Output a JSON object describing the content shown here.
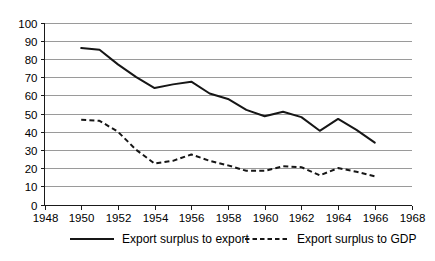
{
  "chart_data": {
    "type": "line",
    "title": "",
    "xlabel": "",
    "ylabel": "",
    "xlim": [
      1948,
      1968
    ],
    "ylim": [
      0,
      100
    ],
    "grid": true,
    "legend_position": "bottom",
    "x_tick_labels": [
      "1948",
      "1950",
      "1952",
      "1954",
      "1956",
      "1958",
      "1960",
      "1962",
      "1964",
      "1966",
      "1968"
    ],
    "x_ticks": [
      1948,
      1950,
      1952,
      1954,
      1956,
      1958,
      1960,
      1962,
      1964,
      1966,
      1968
    ],
    "y_tick_labels": [
      "0",
      "10",
      "20",
      "30",
      "40",
      "50",
      "60",
      "70",
      "80",
      "90",
      "100"
    ],
    "y_ticks": [
      0,
      10,
      20,
      30,
      40,
      50,
      60,
      70,
      80,
      90,
      100
    ],
    "x": [
      1950,
      1951,
      1952,
      1953,
      1954,
      1955,
      1956,
      1957,
      1958,
      1959,
      1960,
      1961,
      1962,
      1963,
      1964,
      1965,
      1966
    ],
    "series": [
      {
        "name": "Export surplus to export",
        "style": "solid",
        "color": "#161616",
        "values": [
          86,
          85,
          77,
          70,
          64,
          66,
          67.5,
          61,
          58,
          52,
          48.5,
          51,
          48,
          40.5,
          47,
          41,
          34
        ]
      },
      {
        "name": "Export surplus to GDP",
        "style": "dashed",
        "color": "#161616",
        "values": [
          46.5,
          46,
          40,
          30,
          22.5,
          24,
          27.5,
          24,
          21.5,
          18.5,
          18.5,
          21,
          20.5,
          16,
          20,
          18,
          15.5
        ]
      }
    ]
  },
  "legend": {
    "items": [
      {
        "label": "Export surplus to export",
        "style": "solid"
      },
      {
        "label": "Export surplus to GDP",
        "style": "dashed"
      }
    ]
  }
}
